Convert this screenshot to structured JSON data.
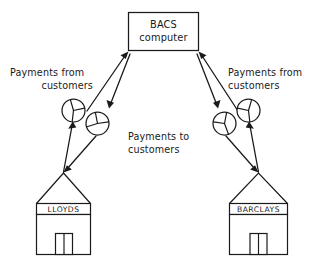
{
  "diagram": {
    "background_color": "#ffffff",
    "ink_color": "#1a1a1a",
    "central_node": {
      "name": "bacs-computer",
      "line1": "BACS",
      "line2": "computer"
    },
    "labels": {
      "left_from_customers_line1": "Payments from",
      "left_from_customers_line2": "customers",
      "right_from_customers_line1": "Payments from",
      "right_from_customers_line2": "customers",
      "to_customers_line1": "Payments to",
      "to_customers_line2": "customers"
    },
    "banks": [
      {
        "name": "lloyds",
        "sign": "LLOYDS"
      },
      {
        "name": "barclays",
        "sign": "BARCLAYS"
      }
    ],
    "money_bags": [
      {
        "name": "money-symbol-lloyds-outgoing"
      },
      {
        "name": "money-symbol-lloyds-incoming"
      },
      {
        "name": "money-symbol-barclays-incoming"
      },
      {
        "name": "money-symbol-barclays-outgoing"
      }
    ],
    "flows": [
      {
        "name": "lloyds-to-bacs",
        "direction": "up"
      },
      {
        "name": "bacs-to-lloyds",
        "direction": "down"
      },
      {
        "name": "barclays-to-bacs",
        "direction": "up"
      },
      {
        "name": "bacs-to-barclays",
        "direction": "down"
      }
    ]
  }
}
